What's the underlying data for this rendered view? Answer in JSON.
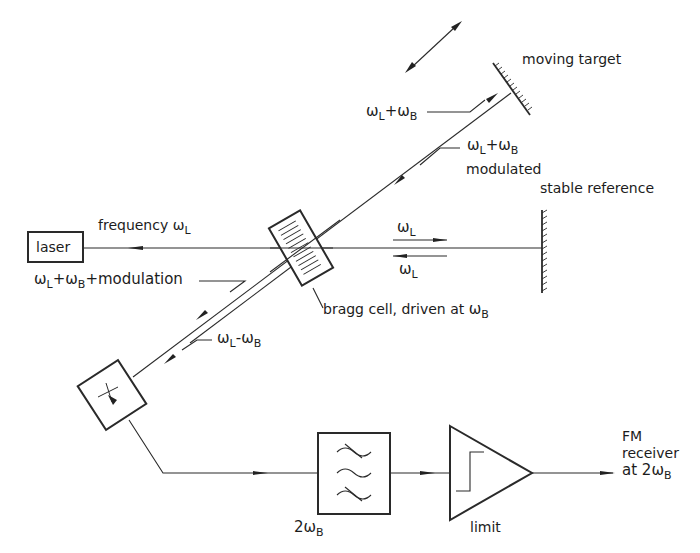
{
  "diagram": {
    "type": "laser doppler interferometer block diagram",
    "components": {
      "laser": {
        "label": "laser"
      },
      "bragg_cell": {
        "label": "bragg cell, driven at",
        "subscript_symbol": "ω",
        "subscript": "B"
      },
      "moving_target": {
        "label": "moving target"
      },
      "stable_reference": {
        "label": "stable reference"
      },
      "detector": {
        "label": ""
      },
      "filter": {
        "label_main": "2ω",
        "label_sub": "B"
      },
      "limiter": {
        "label": "limit"
      },
      "output": {
        "line1": "FM",
        "line2": "receiver",
        "line3_main": "at 2ω",
        "line3_sub": "B"
      }
    },
    "beam_labels": {
      "frequency": {
        "text": "frequency ω",
        "sub": "L"
      },
      "to_target": {
        "a": "ω",
        "a_sub": "L",
        "op": "+",
        "b": "ω",
        "b_sub": "B"
      },
      "from_target": {
        "a": "ω",
        "a_sub": "L",
        "op": "+",
        "b": "ω",
        "b_sub": "B",
        "line2": "modulated"
      },
      "ref_out": {
        "a": "ω",
        "a_sub": "L"
      },
      "ref_back": {
        "a": "ω",
        "a_sub": "L"
      },
      "return_mod": {
        "a": "ω",
        "a_sub": "L",
        "op1": "+",
        "b": "ω",
        "b_sub": "B",
        "op2": "+",
        "tail": "modulation"
      },
      "return_ref": {
        "a": "ω",
        "a_sub": "L",
        "op": "-",
        "b": "ω",
        "b_sub": "B"
      }
    }
  }
}
